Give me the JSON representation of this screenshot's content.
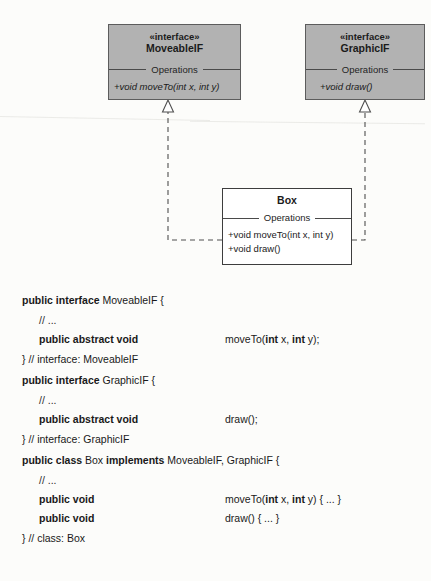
{
  "diagram": {
    "type": "uml-class-diagram",
    "colors": {
      "interface_fill": "#b2b2b2",
      "class_fill": "#ffffff",
      "line": "#4a4a4a",
      "page_background": "#fcfcfa"
    },
    "interfaces": [
      {
        "stereotype": "«interface»",
        "name": "MoveableIF",
        "compartment": "Operations",
        "operations": [
          "+void moveTo(int x, int y)"
        ]
      },
      {
        "stereotype": "«interface»",
        "name": "GraphicIF",
        "compartment": "Operations",
        "operations": [
          "+void draw()"
        ]
      }
    ],
    "classes": [
      {
        "name": "Box",
        "compartment": "Operations",
        "operations": [
          "+void moveTo(int x, int y)",
          "+void draw()"
        ]
      }
    ],
    "relationships": [
      {
        "kind": "realization",
        "from": "Box",
        "to": "MoveableIF",
        "style": "dashed-line-hollow-triangle"
      },
      {
        "kind": "realization",
        "from": "Box",
        "to": "GraphicIF",
        "style": "dashed-line-hollow-triangle"
      }
    ]
  },
  "code": {
    "lines": [
      {
        "left_html": "<span class=\"kw\">public interface</span> MoveableIF {",
        "sig_html": ""
      },
      {
        "left_html": "<span class=\"cmt\">// ...</span>",
        "sig_html": "",
        "indent": true
      },
      {
        "left_html": "<span class=\"kw\">public abstract void</span>",
        "sig_html": "moveTo(<span class=\"kw\">int</span> x, <span class=\"kw\">int</span> y);",
        "indent": true
      },
      {
        "left_html": "} // interface: MoveableIF",
        "sig_html": ""
      },
      {
        "left_html": "<span class=\"kw\">public interface</span> GraphicIF {",
        "sig_html": ""
      },
      {
        "left_html": "<span class=\"cmt\">// ...</span>",
        "sig_html": "",
        "indent": true
      },
      {
        "left_html": "<span class=\"kw\">public abstract void</span>",
        "sig_html": "draw();",
        "indent": true
      },
      {
        "left_html": "} // interface: GraphicIF",
        "sig_html": ""
      },
      {
        "left_html": "<span class=\"kw\">public class</span> Box <span class=\"kw\">implements</span> MoveableIF, GraphicIF {",
        "sig_html": ""
      },
      {
        "left_html": "<span class=\"cmt\">// ...</span>",
        "sig_html": "",
        "indent": true
      },
      {
        "left_html": "<span class=\"kw\">public void</span>",
        "sig_html": "moveTo(<span class=\"kw\">int</span> x, <span class=\"kw\">int</span> y) { ... }",
        "indent": true
      },
      {
        "left_html": "<span class=\"kw\">public void</span>",
        "sig_html": "draw() { ... }",
        "indent": true
      },
      {
        "left_html": "} // class: Box",
        "sig_html": ""
      }
    ],
    "plain_text": [
      "public interface MoveableIF {",
      "    // ...",
      "    public abstract void        moveTo(int x, int y);",
      "} // interface: MoveableIF",
      "public interface GraphicIF {",
      "    // ...",
      "    public abstract void        draw();",
      "} // interface: GraphicIF",
      "public class Box implements MoveableIF, GraphicIF {",
      "    // ...",
      "    public void                 moveTo(int x, int y) { ... }",
      "    public void                 draw() { ... }",
      "} // class: Box"
    ]
  }
}
